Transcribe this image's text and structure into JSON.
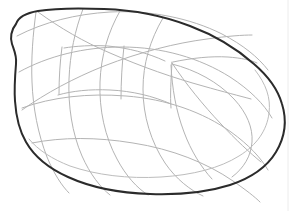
{
  "document": {
    "title": "Line Drawing",
    "kind": "line-art-sketch",
    "subject": "leaf-shaped organic form with construction grid",
    "canvas": {
      "width": 294,
      "height": 211,
      "background_color": "#ffffff"
    }
  },
  "styles": {
    "outline_color": "#2b2b2b",
    "outline_width": 2.0,
    "inner_contour_color": "#bdbdbd",
    "inner_contour_width": 1.0,
    "grid_color": "#b4b4b4",
    "grid_width": 1.0,
    "page_edge_color": "#ececec",
    "page_edge_width": 1
  },
  "shapes": {
    "outer_outline": {
      "name": "leaf-outline",
      "closed": true,
      "path": "M 16 24 C 18 18, 26 13, 38 11 C 56 8, 80 8, 104 9 C 134 10, 164 16, 190 26 C 214 35, 236 48, 254 64 C 268 76, 278 90, 282 104 C 287 120, 285 137, 276 152 C 267 167, 251 178, 230 185 C 208 192, 180 195, 150 194 C 118 193, 90 187, 68 177 C 48 168, 34 156, 26 142 C 19 130, 16 116, 15 101 C 14 88, 15 76, 16 64 C 17 56, 14 50, 12 44 C 10 38, 11 30, 16 24 Z"
    },
    "inner_contour": {
      "name": "inner-rim-contour",
      "closed": false,
      "path": "M 255 70 C 266 84, 271 98, 269 113 C 267 130, 257 145, 239 156 C 220 168, 193 175, 161 177 C 128 179, 96 175, 70 166 C 52 159, 38 150, 29 139"
    },
    "grid_lines": [
      {
        "name": "grid-longitudinal-1",
        "path": "M 36 12 C 33 34, 31 58, 32 82 C 33 108, 38 134, 47 157 C 54 174, 62 186, 69 193"
      },
      {
        "name": "grid-longitudinal-2",
        "path": "M 83 9 C 75 30, 70 54, 69 79 C 68 106, 72 133, 82 156 C 90 174, 100 187, 110 195"
      },
      {
        "name": "grid-longitudinal-3",
        "path": "M 120 11 C 108 32, 101 56, 100 82 C 99 110, 105 137, 117 159 C 126 176, 137 188, 148 195"
      },
      {
        "name": "grid-longitudinal-4",
        "path": "M 163 18 C 150 40, 143 64, 143 89 C 143 116, 151 142, 165 163 C 176 179, 190 190, 203 196"
      },
      {
        "name": "grid-latitudinal-1",
        "path": "M 17 36 C 44 22, 76 14, 110 12 C 150 10, 190 18, 222 34 C 243 45, 258 57, 268 70"
      },
      {
        "name": "grid-latitudinal-2",
        "path": "M 19 72 C 48 56, 84 47, 122 47 C 162 47, 200 58, 230 77 C 250 90, 264 104, 272 118"
      },
      {
        "name": "grid-latitudinal-3",
        "path": "M 22 108 C 52 97, 88 93, 126 96 C 166 99, 203 112, 231 132 C 249 145, 261 158, 268 170"
      },
      {
        "name": "grid-latitudinal-4",
        "path": "M 32 143 C 62 137, 97 137, 133 143 C 172 149, 207 163, 233 181 C 246 190, 255 197, 260 202"
      },
      {
        "name": "grid-diagonal-spine-upper",
        "path": "M 38 12 C 60 28, 84 42, 110 53 C 142 67, 174 78, 203 86 C 224 92, 240 96, 251 99"
      },
      {
        "name": "grid-diagonal-spine-lower",
        "path": "M 22 110 C 46 93, 74 78, 104 66 C 140 52, 176 43, 207 39 C 228 36, 243 35, 252 35"
      },
      {
        "name": "grid-cell-edge-left-upper",
        "path": "M 64 48 C 76 46, 92 45, 108 46 C 128 48, 148 53, 165 61"
      },
      {
        "name": "grid-cell-edge-left-lower",
        "path": "M 58 95 C 72 91, 90 89, 110 90 C 132 91, 153 96, 171 104"
      },
      {
        "name": "grid-cell-short-vertical-a",
        "path": "M 62 47 C 60 62, 59 78, 59 94"
      },
      {
        "name": "grid-cell-short-vertical-b",
        "path": "M 124 46 C 122 64, 121 82, 121 99"
      },
      {
        "name": "grid-cell-short-vertical-c",
        "path": "M 172 62 C 171 80, 170 96, 171 108"
      },
      {
        "name": "grid-lobe-arc-right",
        "path": "M 172 64 C 196 70, 218 82, 234 99 C 247 113, 253 128, 252 142 C 251 156, 244 168, 232 177"
      },
      {
        "name": "grid-lobe-rib-1",
        "path": "M 172 63 C 186 84, 203 105, 221 124 C 236 140, 250 153, 261 162"
      },
      {
        "name": "grid-lobe-rib-2",
        "path": "M 171 65 C 172 88, 176 111, 184 132 C 191 151, 201 167, 212 179"
      },
      {
        "name": "grid-lobe-top-chord",
        "path": "M 173 62 C 192 58, 211 56, 228 57 C 241 58, 251 60, 257 63"
      }
    ]
  },
  "page_edges": {
    "right_edge_x": 288,
    "visible": true
  }
}
